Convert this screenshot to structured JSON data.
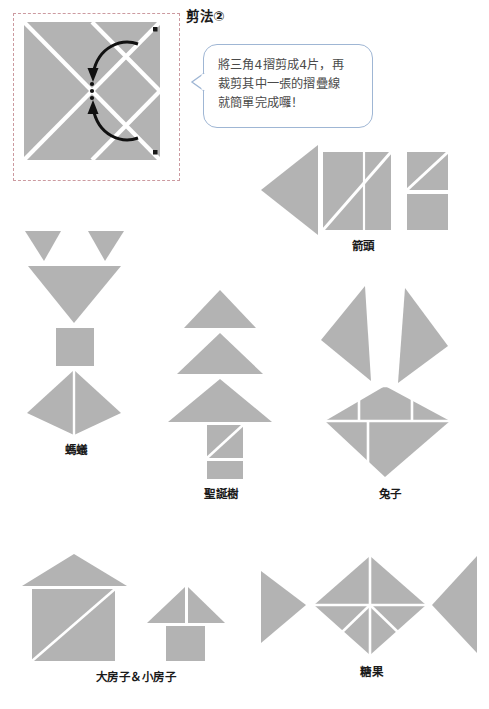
{
  "page": {
    "title": "剪法②",
    "background_color": "#ffffff",
    "shape_fill": "#b3b3b3",
    "shape_gap_color": "#ffffff",
    "frame_border_color": "#cc9aa0",
    "bubble_border_color": "#9fb6d4",
    "label_color": "#1a1a1a"
  },
  "instruction_bubble": {
    "line1": "將三角4摺剪成4片，再",
    "line2": "裁剪其中一張的摺疊線",
    "line3": "就簡單完成囉！",
    "full_text": "將三角4摺剪成4片，再裁剪其中一張的摺疊線就簡單完成囉！"
  },
  "diagram": {
    "name": "folded-square-cut-diagram",
    "arrow_count": 2,
    "dot_count": 3,
    "corner_mark_count": 2
  },
  "figures": [
    {
      "id": "arrow",
      "label": "箭頭",
      "piece_count": 5
    },
    {
      "id": "ant",
      "label": "螞蟻",
      "piece_count": 6
    },
    {
      "id": "christmas-tree",
      "label": "聖誕樹",
      "piece_count": 5
    },
    {
      "id": "rabbit",
      "label": "兔子",
      "piece_count": 6
    },
    {
      "id": "houses",
      "label": "大房子＆小房子",
      "piece_count": 6
    },
    {
      "id": "candy",
      "label": "糖果",
      "piece_count": 7
    }
  ]
}
